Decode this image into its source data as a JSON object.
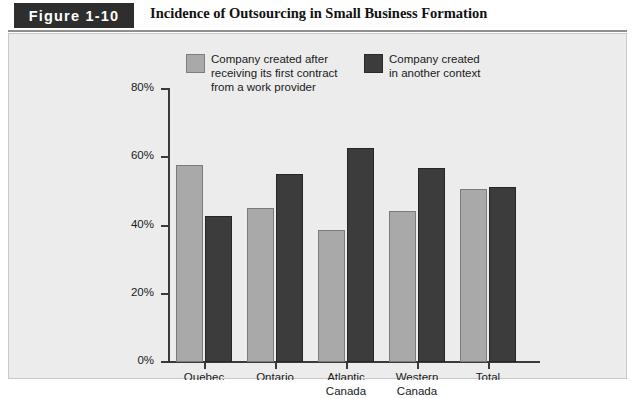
{
  "header": {
    "figure_tag": "Figure 1-10",
    "title": "Incidence of Outsourcing in Small Business Formation"
  },
  "chart_data": {
    "type": "bar",
    "title": "Incidence of Outsourcing in Small Business Formation",
    "xlabel": "",
    "ylabel": "",
    "ylim": [
      0,
      80
    ],
    "ytick_labels": [
      "0%",
      "20%",
      "40%",
      "60%",
      "80%"
    ],
    "ytick_values": [
      0,
      20,
      40,
      60,
      80
    ],
    "grid": false,
    "legend_position": "top-inside",
    "categories": [
      "Quebec",
      "Ontario",
      "Atlantic Canada",
      "Western Canada",
      "Total"
    ],
    "series": [
      {
        "name": "Company created after receiving its first contract from a work provider",
        "color": "#a9a9a9",
        "values": [
          57.5,
          45.0,
          38.5,
          44.0,
          50.5
        ]
      },
      {
        "name": "Company created in another context",
        "color": "#3c3c3c",
        "values": [
          42.5,
          55.0,
          62.5,
          56.5,
          51.0
        ]
      }
    ]
  },
  "legend": {
    "items": [
      {
        "swatch": "light-gray-swatch",
        "line1": "Company created after",
        "line2": "receiving its first contract",
        "line3": "from a work provider"
      },
      {
        "swatch": "dark-gray-swatch",
        "line1": "Company created",
        "line2": "in another context",
        "line3": ""
      }
    ]
  },
  "axis": {
    "y_labels": [
      "80%",
      "60%",
      "40%",
      "20%",
      "0%"
    ],
    "x_labels": [
      {
        "line1": "Quebec",
        "line2": ""
      },
      {
        "line1": "Ontario",
        "line2": ""
      },
      {
        "line1": "Atlantic",
        "line2": "Canada"
      },
      {
        "line1": "Western",
        "line2": "Canada"
      },
      {
        "line1": "Total",
        "line2": ""
      }
    ]
  },
  "colors": {
    "series_light": "#a9a9a9",
    "series_dark": "#3c3c3c",
    "panel_background": "#ececec",
    "axis": "#3a3a3a",
    "tag_background": "#2e2e2e"
  }
}
